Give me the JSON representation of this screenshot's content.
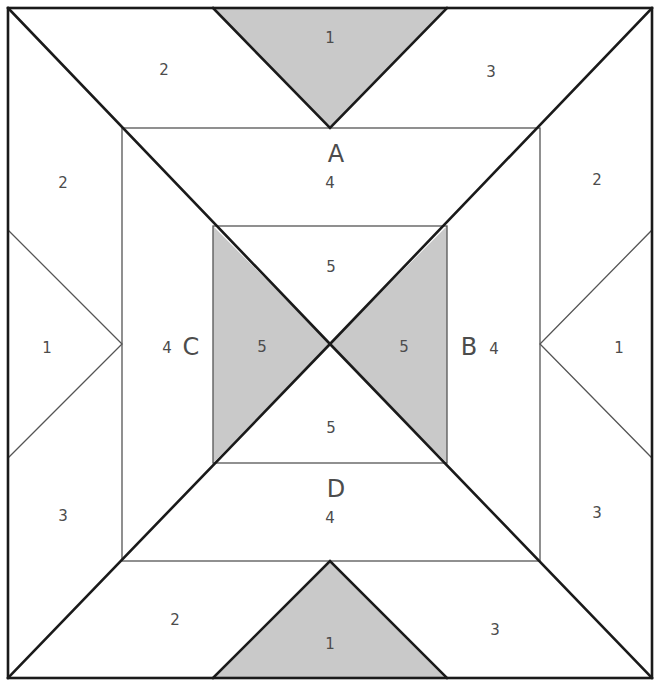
{
  "figure": {
    "canvas": {
      "width": 661,
      "height": 686
    },
    "colors": {
      "shaded": "#c9c9c9",
      "unshaded": "#ffffff",
      "stroke_major": "#1a1a1a",
      "stroke_minor": "#555555",
      "label_text": "#4c4c4c"
    },
    "geometry": {
      "outer_square": {
        "left": 8,
        "top": 8,
        "right": 652,
        "bottom": 678
      },
      "middle_square": {
        "left": 122,
        "top": 128,
        "right": 540,
        "bottom": 561
      },
      "inner_square": {
        "left": 213,
        "top": 226,
        "right": 447,
        "bottom": 463
      },
      "center_point": {
        "x": 330,
        "y": 344
      }
    }
  },
  "corner_labels": {
    "top": {
      "letter": "A",
      "number": "4"
    },
    "right": {
      "letter": "B",
      "number": "4"
    },
    "left": {
      "letter": "C",
      "number": "4"
    },
    "bottom": {
      "letter": "D",
      "number": "4"
    }
  },
  "region_labels": [
    {
      "id": "top-shaded-triangle",
      "text": "1",
      "x": 330,
      "y": 38,
      "shaded": true
    },
    {
      "id": "top-left-trapezoid",
      "text": "2",
      "x": 164,
      "y": 70,
      "shaded": false
    },
    {
      "id": "top-right-trapezoid",
      "text": "3",
      "x": 491,
      "y": 72,
      "shaded": false
    },
    {
      "id": "upper-left-band",
      "text": "2",
      "x": 63,
      "y": 183,
      "shaded": false
    },
    {
      "id": "upper-right-band",
      "text": "2",
      "x": 597,
      "y": 180,
      "shaded": false
    },
    {
      "id": "left-white-triangle",
      "text": "1",
      "x": 47,
      "y": 348,
      "shaded": false
    },
    {
      "id": "right-white-triangle",
      "text": "1",
      "x": 619,
      "y": 348,
      "shaded": false
    },
    {
      "id": "ring-left-quad",
      "text": "4",
      "x": 167,
      "y": 348,
      "shaded": false
    },
    {
      "id": "ring-right-quad",
      "text": "4",
      "x": 494,
      "y": 349,
      "shaded": false
    },
    {
      "id": "ring-top-quad",
      "text": "4",
      "x": 330,
      "y": 183,
      "shaded": false
    },
    {
      "id": "ring-bottom-quad",
      "text": "4",
      "x": 330,
      "y": 518,
      "shaded": false
    },
    {
      "id": "inner-top-triangle",
      "text": "5",
      "x": 331,
      "y": 267,
      "shaded": false
    },
    {
      "id": "inner-left-triangle",
      "text": "5",
      "x": 262,
      "y": 347,
      "shaded": true
    },
    {
      "id": "inner-right-triangle",
      "text": "5",
      "x": 404,
      "y": 347,
      "shaded": true
    },
    {
      "id": "inner-bottom-triangle",
      "text": "5",
      "x": 331,
      "y": 428,
      "shaded": false
    },
    {
      "id": "lower-left-band",
      "text": "3",
      "x": 63,
      "y": 516,
      "shaded": false
    },
    {
      "id": "lower-right-band",
      "text": "3",
      "x": 597,
      "y": 513,
      "shaded": false
    },
    {
      "id": "bottom-left-trapezoid",
      "text": "2",
      "x": 175,
      "y": 620,
      "shaded": false
    },
    {
      "id": "bottom-right-trapezoid",
      "text": "3",
      "x": 495,
      "y": 630,
      "shaded": false
    },
    {
      "id": "bottom-shaded-triangle",
      "text": "1",
      "x": 330,
      "y": 644,
      "shaded": true
    }
  ],
  "shaded_regions": [
    {
      "id": "top-triangle",
      "points": "213,8 447,8 330,128"
    },
    {
      "id": "bottom-triangle",
      "points": "213,678 447,678 330,561"
    },
    {
      "id": "inner-left-triangle",
      "points": "213,226 330,344 213,463"
    },
    {
      "id": "inner-right-triangle",
      "points": "447,226 330,344 447,463"
    }
  ]
}
